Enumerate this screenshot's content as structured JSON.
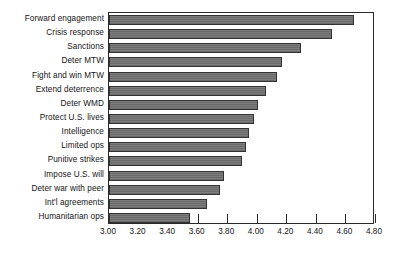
{
  "chart_data": {
    "type": "bar",
    "orientation": "horizontal",
    "title": "",
    "subtitle": "",
    "xlabel": "",
    "ylabel": "",
    "xlim": [
      3.0,
      4.8
    ],
    "xtick_step": 0.2,
    "xticks": [
      "3.00",
      "3.20",
      "3.40",
      "3.60",
      "3.80",
      "4.00",
      "4.20",
      "4.40",
      "4.60",
      "4.80"
    ],
    "xtick_values": [
      3.0,
      3.2,
      3.4,
      3.6,
      3.8,
      4.0,
      4.2,
      4.4,
      4.6,
      4.8
    ],
    "grid": false,
    "legend": "none",
    "bar_color": "#6e6e6e",
    "bar_edge_color": "#333333",
    "axis_color": "#2a2a2a",
    "categories": [
      "Forward engagement",
      "Crisis response",
      "Sanctions",
      "Deter MTW",
      "Fight and win MTW",
      "Extend deterrence",
      "Deter WMD",
      "Protect U.S. lives",
      "Intelligence",
      "Limited ops",
      "Punitive strikes",
      "Impose U.S. will",
      "Deter war with peer",
      "Int'l agreements",
      "Humanitarian ops"
    ],
    "values": [
      4.66,
      4.51,
      4.3,
      4.17,
      4.14,
      4.06,
      4.01,
      3.98,
      3.95,
      3.93,
      3.9,
      3.78,
      3.75,
      3.66,
      3.55
    ]
  }
}
